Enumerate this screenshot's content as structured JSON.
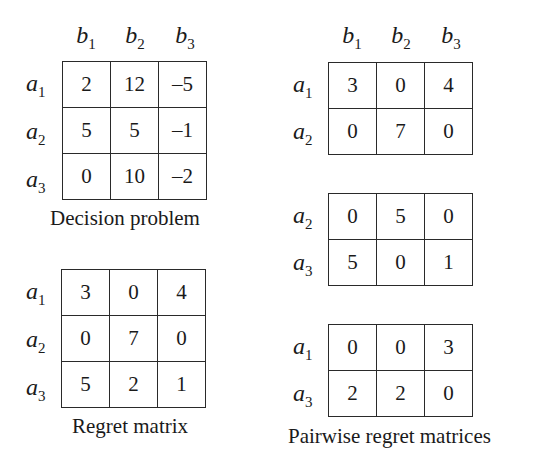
{
  "decision_problem": {
    "caption": "Decision problem",
    "columns": [
      "b1",
      "b2",
      "b3"
    ],
    "rows": [
      {
        "label": "a1",
        "values": [
          "2",
          "12",
          "–5"
        ]
      },
      {
        "label": "a2",
        "values": [
          "5",
          "5",
          "–1"
        ]
      },
      {
        "label": "a3",
        "values": [
          "0",
          "10",
          "–2"
        ]
      }
    ]
  },
  "regret_matrix": {
    "caption": "Regret matrix",
    "rows": [
      {
        "label": "a1",
        "values": [
          "3",
          "0",
          "4"
        ]
      },
      {
        "label": "a2",
        "values": [
          "0",
          "7",
          "0"
        ]
      },
      {
        "label": "a3",
        "values": [
          "5",
          "2",
          "1"
        ]
      }
    ]
  },
  "pairwise_regret_matrices": {
    "caption": "Pairwise regret matrices",
    "columns": [
      "b1",
      "b2",
      "b3"
    ],
    "matrices": [
      {
        "rows": [
          {
            "label": "a1",
            "values": [
              "3",
              "0",
              "4"
            ]
          },
          {
            "label": "a2",
            "values": [
              "0",
              "7",
              "0"
            ]
          }
        ]
      },
      {
        "rows": [
          {
            "label": "a2",
            "values": [
              "0",
              "5",
              "0"
            ]
          },
          {
            "label": "a3",
            "values": [
              "5",
              "0",
              "1"
            ]
          }
        ]
      },
      {
        "rows": [
          {
            "label": "a1",
            "values": [
              "0",
              "0",
              "3"
            ]
          },
          {
            "label": "a3",
            "values": [
              "2",
              "2",
              "0"
            ]
          }
        ]
      }
    ]
  }
}
